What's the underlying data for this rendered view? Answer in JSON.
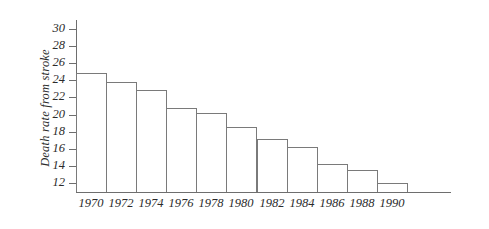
{
  "chart_data": {
    "type": "bar",
    "title": "",
    "xlabel": "",
    "ylabel": "Death rate from stroke",
    "categories": [
      "1970",
      "1972",
      "1974",
      "1976",
      "1978",
      "1980",
      "1982",
      "1984",
      "1986",
      "1988",
      "1990"
    ],
    "values": [
      24.8,
      23.8,
      22.9,
      20.8,
      20.2,
      18.6,
      17.2,
      16.2,
      14.3,
      13.6,
      12.1
    ],
    "ytick_labels": [
      "30",
      "28",
      "26",
      "24",
      "22",
      "20",
      "18",
      "16",
      "14",
      "12"
    ],
    "ytick_values": [
      30,
      28,
      26,
      24,
      22,
      20,
      18,
      16,
      14,
      12
    ],
    "ylim": [
      11.0,
      31.0
    ],
    "grid": false,
    "legend": false,
    "legend_position": "none",
    "axis_color": "#6e6e6e",
    "bar_edge_color": "#7a7a7a",
    "bar_fill_color": "#ffffff",
    "text_color": "#2b2b2b",
    "background_color": "#ffffff"
  }
}
